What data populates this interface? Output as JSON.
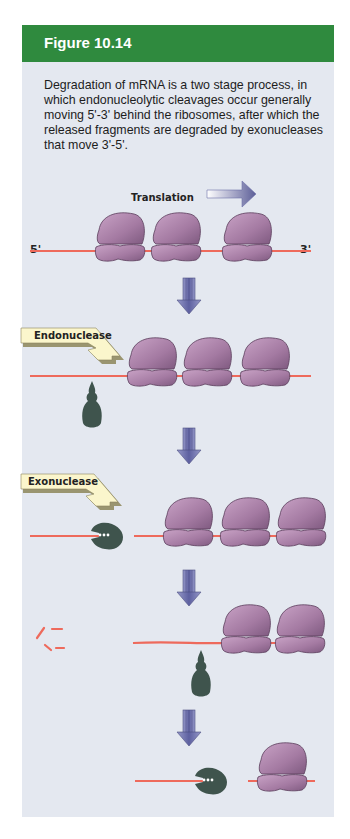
{
  "figure": {
    "title": "Figure 10.14",
    "caption": "Degradation of mRNA is a two stage process, in which endonucleolytic cleavages occur generally moving 5'-3' behind the ribosomes, after which the released fragments are degraded by exonucleases that move 3'-5'."
  },
  "diagram": {
    "translation_label": "Translation",
    "five_prime_label": "5'",
    "three_prime_label": "3'",
    "endonuclease_label": "Endonuclease",
    "exonuclease_label": "Exonuclease",
    "stages": [
      {
        "name": "translation",
        "ribosomes": 3
      },
      {
        "name": "endonuclease-cleavage",
        "ribosomes": 3
      },
      {
        "name": "exonuclease-degradation",
        "ribosomes": 3
      },
      {
        "name": "second-endonuclease-cleavage",
        "ribosomes": 2
      },
      {
        "name": "second-exonuclease-degradation",
        "ribosomes": 1
      }
    ],
    "colors": {
      "header": "#2f8a3e",
      "panel": "#e4e8f0",
      "mrna": "#ee6a5c",
      "ribosome": "#a47aa2",
      "enzyme": "#3f544d",
      "callout": "#fbf6cc",
      "arrow": "#6c6fa8"
    }
  }
}
